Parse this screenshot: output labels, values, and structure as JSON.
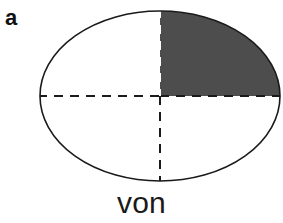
{
  "figure": {
    "panel_label": "a",
    "caption": "von",
    "background_color": "#ffffff"
  },
  "diagram": {
    "type": "ellipse-quadrant-shading",
    "outline_color": "#1a1a1a",
    "outline_width": 1.6,
    "shaded_fill_color": "#4d4d4d",
    "unshaded_fill_color": "#ffffff",
    "divider_color": "#1a1a1a",
    "divider_on_shaded_color": "#ffffff",
    "divider_dash": "9 7",
    "divider_width": 2,
    "ellipse": {
      "cx": 160,
      "cy": 96,
      "rx": 120,
      "ry": 85
    },
    "quadrants": [
      {
        "name": "upper-left",
        "shaded": false,
        "fill": "#ffffff"
      },
      {
        "name": "upper-right",
        "shaded": true,
        "fill": "#4d4d4d"
      },
      {
        "name": "lower-left",
        "shaded": false,
        "fill": "#ffffff"
      },
      {
        "name": "lower-right",
        "shaded": false,
        "fill": "#ffffff"
      }
    ],
    "horizontal_divider": {
      "x1": 40,
      "y1": 96,
      "x2": 280,
      "y2": 96
    },
    "vertical_divider": {
      "x1": 160,
      "y1": 11,
      "x2": 160,
      "y2": 181
    }
  }
}
